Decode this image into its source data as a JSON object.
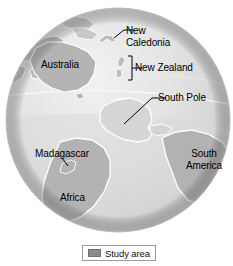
{
  "figure": {
    "type": "map",
    "projection": "orthographic-globe"
  },
  "map": {
    "labels": [
      {
        "id": "australia",
        "text": "Australia",
        "name": "map-label-australia"
      },
      {
        "id": "new_caledonia",
        "text": "New Caledonia",
        "name": "map-label-new-caledonia"
      },
      {
        "id": "new_zealand",
        "text": "New Zealand",
        "name": "map-label-new-zealand"
      },
      {
        "id": "south_pole",
        "text": "South Pole",
        "name": "map-label-south-pole"
      },
      {
        "id": "madagascar",
        "text": "Madagascar",
        "name": "map-label-madagascar"
      },
      {
        "id": "africa",
        "text": "Africa",
        "name": "map-label-africa"
      },
      {
        "id": "south_america",
        "text": "South America",
        "name": "map-label-south-america"
      }
    ],
    "label_text": {
      "australia": "Australia",
      "new_caledonia_line1": "New",
      "new_caledonia_line2": "Caledonia",
      "new_zealand": "New Zealand",
      "south_pole": "South Pole",
      "madagascar": "Madagascar",
      "africa": "Africa",
      "south_america_line1": "South",
      "south_america_line2": "America"
    },
    "colors": {
      "ocean_light": "#e9e9e9",
      "ocean_mid": "#dcdcdc",
      "ocean_shade": "#c3c3c3",
      "land": "#b6b6b6",
      "land_light": "#cfcfcf",
      "study_area": "#d5d5d5",
      "outline": "#ffffff",
      "leader_line": "#000000",
      "text": "#000000",
      "background": "#ffffff"
    },
    "features": {
      "study_area_feature": "Antarctica",
      "graticule_visible": true
    }
  },
  "legend": {
    "label": "Study area",
    "swatch_color": "#8c8c8c",
    "border_color": "#9a9a9a"
  }
}
